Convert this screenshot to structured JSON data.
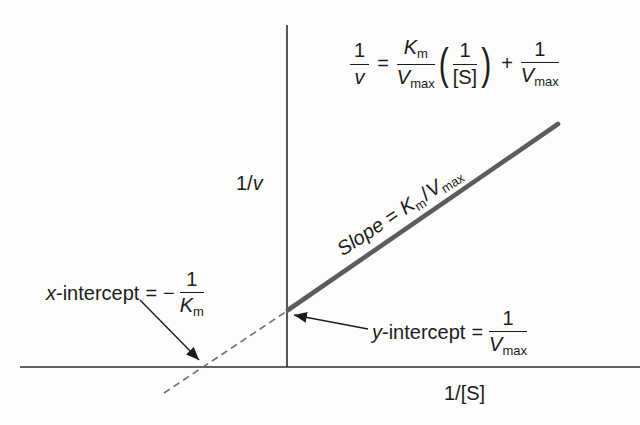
{
  "axis_labels": {
    "y_pre": "1/",
    "y_var": "v",
    "x": "1/[S]"
  },
  "equation": {
    "lhs_num": "1",
    "lhs_den": "v",
    "equals": "=",
    "slope_num_base": "K",
    "slope_num_sub": "m",
    "slope_den_base": "V",
    "slope_den_sub": "max",
    "paren_open": "(",
    "paren_num": "1",
    "paren_den": "[S]",
    "paren_close": ")",
    "plus": "+",
    "int_num": "1",
    "int_den_base": "V",
    "int_den_sub": "max"
  },
  "slope_label": {
    "word": "Slope",
    "equals": "=",
    "k_base": "K",
    "k_sub": "m",
    "slash": "/",
    "v_base": "V",
    "v_sub": "max"
  },
  "x_intercept": {
    "var": "x",
    "text": "-intercept",
    "equals": "=",
    "minus": "−",
    "num": "1",
    "den_base": "K",
    "den_sub": "m"
  },
  "y_intercept": {
    "var": "y",
    "text": "-intercept",
    "equals": "=",
    "num": "1",
    "den_base": "V",
    "den_sub": "max"
  },
  "colors": {
    "axis": "#2e2e2e",
    "line": "#5c5c5c",
    "dashed": "#6e6e6e",
    "text": "#1c1c1c",
    "background": "#fdfdfc"
  }
}
